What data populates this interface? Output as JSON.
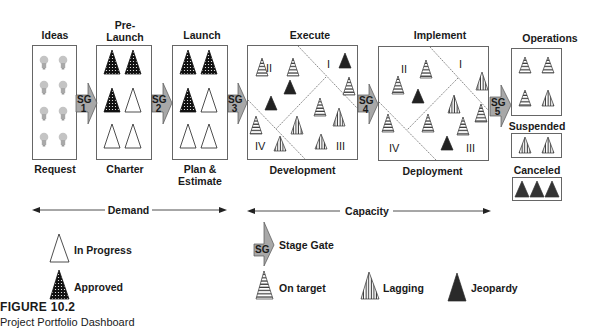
{
  "stages": [
    {
      "id": "ideas",
      "title": "Ideas",
      "bottom": "Request"
    },
    {
      "id": "prelaunch",
      "title": "Pre-\nLaunch",
      "title_line1": "Pre-",
      "title_line2": "Launch",
      "bottom": "Charter"
    },
    {
      "id": "launch",
      "title": "Launch",
      "bottom_line1": "Plan &",
      "bottom_line2": "Estimate"
    },
    {
      "id": "execute",
      "title": "Execute",
      "bottom": "Development"
    },
    {
      "id": "implement",
      "title": "Implement",
      "bottom": "Deployment"
    },
    {
      "id": "operations",
      "title": "Operations"
    },
    {
      "id": "suspended",
      "title": "Suspended"
    },
    {
      "id": "canceled",
      "title": "Canceled"
    }
  ],
  "gates": [
    {
      "label": "SG",
      "num": "1"
    },
    {
      "label": "SG",
      "num": "2"
    },
    {
      "label": "SG",
      "num": "3"
    },
    {
      "label": "SG",
      "num": "4"
    },
    {
      "label": "SG",
      "num": "5"
    }
  ],
  "quadrants": [
    "I",
    "II",
    "III",
    "IV"
  ],
  "ranges": {
    "demand": "Demand",
    "capacity": "Capacity"
  },
  "legend": {
    "in_progress": "In Progress",
    "approved": "Approved",
    "stage_gate_label": "SG",
    "stage_gate": "Stage Gate",
    "on_target": "On target",
    "lagging": "Lagging",
    "jeopardy": "Jeopardy"
  },
  "caption": {
    "title": "FIGURE 10.2",
    "subtitle": "Project Portfolio Dashboard"
  },
  "colors": {
    "gate_fill": "#a8a8a8",
    "jeopardy": "#222222",
    "bulb": "#b5b5b5"
  }
}
